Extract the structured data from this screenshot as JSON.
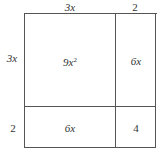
{
  "diagram": {
    "type": "area-model",
    "top_labels": [
      "3x",
      "2"
    ],
    "side_labels": [
      "3x",
      "2"
    ],
    "cells": [
      [
        "9x²",
        "6x"
      ],
      [
        "6x",
        "4"
      ]
    ],
    "colors": {
      "line": "#555555",
      "text": "#333333",
      "background": "#ffffff"
    }
  },
  "labels": {
    "top_left": "3x",
    "top_right": "2",
    "side_top": "3x",
    "side_bottom": "2",
    "cell_tl": "9x²",
    "cell_tr": "6x",
    "cell_bl": "6x",
    "cell_br": "4"
  }
}
